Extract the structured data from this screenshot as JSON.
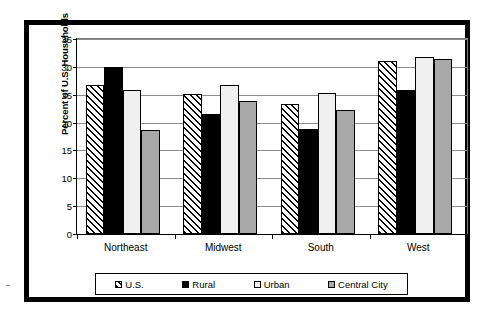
{
  "chart_data": {
    "type": "bar",
    "title": "",
    "xlabel": "",
    "ylabel": "Percent of U.S. Households",
    "ylim": [
      0,
      35
    ],
    "yticks": [
      0,
      5,
      10,
      15,
      20,
      25,
      30,
      35
    ],
    "grid": true,
    "legend_position": "bottom",
    "categories": [
      "Northeast",
      "Midwest",
      "South",
      "West"
    ],
    "series": [
      {
        "name": "U.S.",
        "pattern": "diagonal-hatch",
        "color": "#ffffff",
        "values": [
          26.8,
          25.2,
          23.3,
          31.1
        ]
      },
      {
        "name": "Rural",
        "pattern": "solid",
        "color": "#000000",
        "values": [
          30.0,
          21.5,
          18.9,
          25.9
        ]
      },
      {
        "name": "Urban",
        "pattern": "solid",
        "color": "#f0f0f0",
        "values": [
          25.8,
          26.8,
          25.3,
          31.7
        ]
      },
      {
        "name": "Central City",
        "pattern": "solid",
        "color": "#a8a8a8",
        "values": [
          18.7,
          23.8,
          22.3,
          31.5
        ]
      }
    ]
  },
  "axis": {
    "y_title": "Percent of U.S. Households",
    "y_tick_labels": [
      "0",
      "5",
      "10",
      "15",
      "20",
      "25",
      "30",
      "35"
    ],
    "x_tick_labels": [
      "Northeast",
      "Midwest",
      "South",
      "West"
    ]
  },
  "legend": {
    "entries": [
      {
        "label": "U.S."
      },
      {
        "label": "Rural"
      },
      {
        "label": "Urban"
      },
      {
        "label": "Central City"
      }
    ]
  }
}
